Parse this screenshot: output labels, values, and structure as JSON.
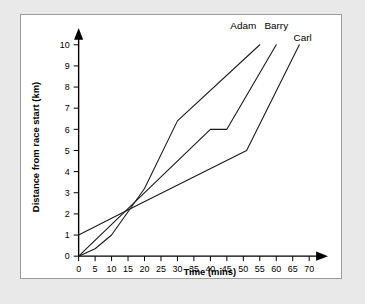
{
  "chart_data": {
    "type": "line",
    "title": "",
    "xlabel": "Time (mins)",
    "ylabel": "Distance from race start (km)",
    "xlim": [
      0,
      70
    ],
    "ylim": [
      0,
      10
    ],
    "xticks": [
      0,
      5,
      10,
      15,
      20,
      25,
      30,
      35,
      40,
      45,
      50,
      55,
      60,
      65,
      70
    ],
    "yticks": [
      0,
      1,
      2,
      3,
      4,
      5,
      6,
      7,
      8,
      9,
      10
    ],
    "grid": false,
    "legend_position": "line-end-labels",
    "series": [
      {
        "name": "Adam",
        "label_x": 50,
        "label_y": 10.75,
        "points": [
          {
            "x": 0,
            "y": 0
          },
          {
            "x": 5,
            "y": 0.35
          },
          {
            "x": 10,
            "y": 1.0
          },
          {
            "x": 20,
            "y": 3.2
          },
          {
            "x": 30,
            "y": 6.4
          },
          {
            "x": 55,
            "y": 10
          }
        ]
      },
      {
        "name": "Barry",
        "label_x": 60,
        "label_y": 10.75,
        "points": [
          {
            "x": 0,
            "y": 0
          },
          {
            "x": 40,
            "y": 6
          },
          {
            "x": 45,
            "y": 6
          },
          {
            "x": 60,
            "y": 10
          }
        ]
      },
      {
        "name": "Carl",
        "label_x": 68,
        "label_y": 10.2,
        "points": [
          {
            "x": 0,
            "y": 1
          },
          {
            "x": 19,
            "y": 2.5
          },
          {
            "x": 51,
            "y": 5
          },
          {
            "x": 67,
            "y": 10
          }
        ]
      }
    ]
  },
  "colors": {
    "page_background": "#e9e9e9",
    "panel_background": "#ffffff",
    "panel_border": "#9b9b9b",
    "axis": "#000000",
    "line": "#1a1a1a"
  }
}
